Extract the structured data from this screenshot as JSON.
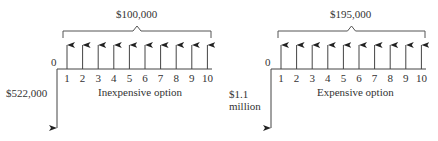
{
  "diagrams": [
    {
      "name": "inexpensive",
      "caption": "Inexpensive option",
      "annual_label": "$100,000",
      "initial_label": "$522,000",
      "zero_label": "0",
      "periods": [
        "1",
        "2",
        "3",
        "4",
        "5",
        "6",
        "7",
        "8",
        "9",
        "10"
      ]
    },
    {
      "name": "expensive",
      "caption": "Expensive option",
      "annual_label": "$195,000",
      "initial_label_line1": "$1.1",
      "initial_label_line2": "million",
      "zero_label": "0",
      "periods": [
        "1",
        "2",
        "3",
        "4",
        "5",
        "6",
        "7",
        "8",
        "9",
        "10"
      ]
    }
  ]
}
